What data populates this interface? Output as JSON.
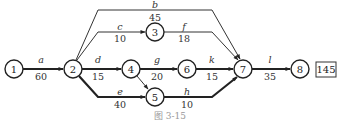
{
  "diagram": {
    "type": "activity-on-arrow network",
    "caption": "图 3-15",
    "total_duration_box": "145",
    "nodes": [
      {
        "id": "1",
        "label": "1"
      },
      {
        "id": "2",
        "label": "2"
      },
      {
        "id": "3",
        "label": "3"
      },
      {
        "id": "4",
        "label": "4"
      },
      {
        "id": "5",
        "label": "5"
      },
      {
        "id": "6",
        "label": "6"
      },
      {
        "id": "7",
        "label": "7"
      },
      {
        "id": "8",
        "label": "8"
      }
    ],
    "edges": [
      {
        "name": "a",
        "duration": "60",
        "from": "1",
        "to": "2",
        "critical": true
      },
      {
        "name": "b",
        "duration": "45",
        "from": "2",
        "to": "7",
        "critical": false
      },
      {
        "name": "c",
        "duration": "10",
        "from": "2",
        "to": "3",
        "critical": false
      },
      {
        "name": "d",
        "duration": "15",
        "from": "2",
        "to": "4",
        "critical": false
      },
      {
        "name": "e",
        "duration": "40",
        "from": "2",
        "to": "5",
        "critical": true
      },
      {
        "name": "f",
        "duration": "18",
        "from": "3",
        "to": "7",
        "critical": false
      },
      {
        "name": "g",
        "duration": "20",
        "from": "4",
        "to": "6",
        "critical": false
      },
      {
        "name": "k",
        "duration": "15",
        "from": "6",
        "to": "7",
        "critical": false
      },
      {
        "name": "h",
        "duration": "10",
        "from": "5",
        "to": "7",
        "critical": true
      },
      {
        "name": "l",
        "duration": "35",
        "from": "7",
        "to": "8",
        "critical": true
      },
      {
        "name": "dummy",
        "duration": "",
        "from": "4",
        "to": "5",
        "critical": false
      }
    ]
  }
}
